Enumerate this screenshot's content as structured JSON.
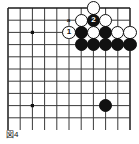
{
  "figure": {
    "caption": "図4",
    "kind": "go-board-diagram"
  },
  "board": {
    "cols": 11,
    "rows": 10,
    "origin_x": 8,
    "origin_y": 8,
    "spacing": 12.2,
    "line_color": "#3a3a3a",
    "edge_color": "#1a1a1a",
    "background": "#ffffff",
    "star_points": [
      {
        "col": 2,
        "row": 2
      },
      {
        "col": 2,
        "row": 8
      }
    ]
  },
  "stones": [
    {
      "color": "white",
      "col": 7,
      "row": 0,
      "label": ""
    },
    {
      "color": "white",
      "col": 6,
      "row": 1,
      "label": ""
    },
    {
      "color": "black",
      "col": 7,
      "row": 1,
      "label": "2"
    },
    {
      "color": "white",
      "col": 8,
      "row": 1,
      "label": ""
    },
    {
      "color": "white",
      "col": 5,
      "row": 2,
      "label": "1"
    },
    {
      "color": "black",
      "col": 6,
      "row": 2,
      "label": ""
    },
    {
      "color": "white",
      "col": 7,
      "row": 2,
      "label": ""
    },
    {
      "color": "black",
      "col": 8,
      "row": 2,
      "label": ""
    },
    {
      "color": "white",
      "col": 9,
      "row": 2,
      "label": ""
    },
    {
      "color": "white",
      "col": 10,
      "row": 2,
      "label": ""
    },
    {
      "color": "black",
      "col": 6,
      "row": 3,
      "label": ""
    },
    {
      "color": "black",
      "col": 7,
      "row": 3,
      "label": ""
    },
    {
      "color": "black",
      "col": 8,
      "row": 3,
      "label": ""
    },
    {
      "color": "black",
      "col": 9,
      "row": 3,
      "label": ""
    },
    {
      "color": "black",
      "col": 10,
      "row": 3,
      "label": ""
    },
    {
      "color": "black",
      "col": 8,
      "row": 8,
      "label": ""
    }
  ],
  "markers": [
    {
      "text": "a",
      "col": 5,
      "row": 1
    }
  ]
}
